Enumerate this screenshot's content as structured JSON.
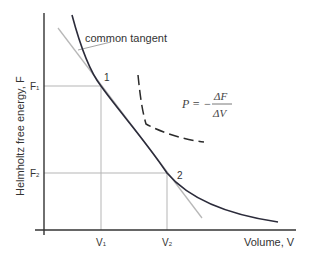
{
  "diagram": {
    "y_axis_label": "Helmholtz free energy, F",
    "x_axis_label": "Volume, V",
    "annotation_label": "common tangent",
    "formula": {
      "lhs": "P = −",
      "numerator": "ΔF",
      "denominator": "ΔV"
    },
    "points": [
      {
        "label": "1",
        "f_label": "F",
        "f_sub": "1",
        "v_label": "V",
        "v_sub": "1"
      },
      {
        "label": "2",
        "f_label": "F",
        "f_sub": "2",
        "v_label": "V",
        "v_sub": "2"
      }
    ],
    "colors": {
      "axis": "#333333",
      "curve": "#2b2b3a",
      "tangent": "#b8b8b8",
      "guide": "#b5b5b5",
      "dashed": "#2b2b2b"
    }
  }
}
